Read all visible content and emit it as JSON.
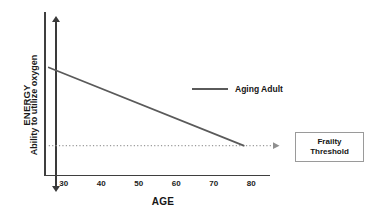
{
  "chart_data": {
    "type": "line",
    "title": "",
    "xlabel": "AGE",
    "ylabel": "ENERGY",
    "ylabel_secondary": "Ability to utilize oxygen",
    "xlim": [
      25,
      85
    ],
    "ylim": [
      0,
      100
    ],
    "xticks": [
      30,
      40,
      50,
      60,
      70,
      80
    ],
    "xtick_labels": [
      "30",
      "40",
      "50",
      "60",
      "70",
      "80"
    ],
    "yticks": [],
    "ytick_labels": [],
    "grid": false,
    "legend_position": "upper-right-inside",
    "series": [
      {
        "name": "Aging Adult",
        "style": "solid",
        "color": "#5a5a5a",
        "x": [
          26,
          78
        ],
        "y": [
          66,
          18
        ]
      },
      {
        "name": "Frailty Threshold",
        "style": "dotted",
        "color": "#9a9a9a",
        "x": [
          26,
          85
        ],
        "y": [
          18,
          18
        ],
        "is_reference_line": true,
        "arrow_end": true
      }
    ],
    "annotations": [
      {
        "name": "frailty-threshold-callout",
        "text": "Frailty Threshold",
        "lines": [
          "Frailty",
          "Threshold"
        ],
        "boxed": true
      }
    ]
  },
  "axes": {
    "y_primary_label": "ENERGY",
    "y_secondary_label": "Ability to utilize oxygen",
    "x_title": "AGE",
    "xtick_labels": [
      "30",
      "40",
      "50",
      "60",
      "70",
      "80"
    ]
  },
  "legend": {
    "entries": [
      {
        "label": "Aging Adult",
        "color": "#5a5a5a"
      }
    ]
  },
  "callout": {
    "line1": "Frailty",
    "line2": "Threshold"
  },
  "colors": {
    "axis": "#3f3f3f",
    "data_line": "#5a5a5a",
    "threshold_line": "#9a9a9a",
    "text": "#141414",
    "background": "#ffffff"
  }
}
